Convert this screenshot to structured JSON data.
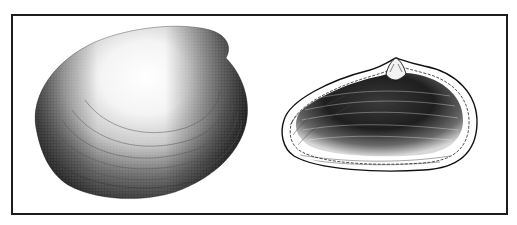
{
  "figure": {
    "type": "scientific illustration",
    "caption_top_visible": "",
    "frame_color": "#1c1c1c",
    "background_color": "#ffffff",
    "panels": [
      {
        "id": "left",
        "view": "exterior of valve",
        "shading": "stippled, dark at posterior and margins, light highlight at center-top"
      },
      {
        "id": "right",
        "view": "interior of valve",
        "shading": "hatched dark interior with pale rim, beak and hinge tooth at top center"
      }
    ]
  }
}
